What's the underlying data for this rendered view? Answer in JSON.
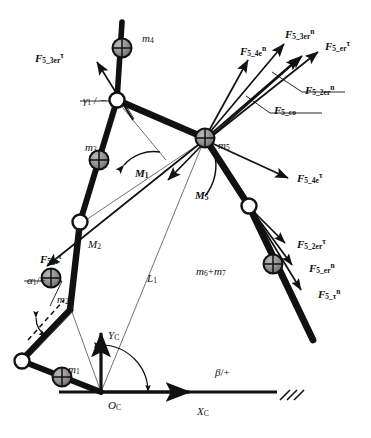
{
  "figure": {
    "type": "mechanism-free-body-diagram",
    "background": "#ffffff",
    "stroke": "#111111",
    "link_color": "#111111",
    "mass_fill": "#8a8a8a",
    "joint_fill": "#ffffff",
    "width": 371,
    "height": 438
  },
  "forces": [
    {
      "id": "f_5_3er_tau_left",
      "base": "F",
      "sub": "5_3er",
      "sup": "τ",
      "x": 35,
      "y": 52
    },
    {
      "id": "f_5_4e_n",
      "base": "F",
      "sub": "5_4e",
      "sup": "n",
      "x": 240,
      "y": 45
    },
    {
      "id": "f_5_3er_n",
      "base": "F",
      "sub": "5_3er",
      "sup": "n",
      "x": 285,
      "y": 28
    },
    {
      "id": "f_5_er_tau",
      "base": "F",
      "sub": "5_er",
      "sup": "τ",
      "x": 325,
      "y": 40
    },
    {
      "id": "f_5_2er_n",
      "base": "F",
      "sub": "5_2er",
      "sup": "n",
      "x": 305,
      "y": 84
    },
    {
      "id": "f_5_co",
      "base": "F",
      "sub": "5_co",
      "sup": "",
      "x": 274,
      "y": 105
    },
    {
      "id": "f_5_4e_tau",
      "base": "F",
      "sub": "5_4e",
      "sup": "τ",
      "x": 297,
      "y": 172
    },
    {
      "id": "f_5_2er_tau",
      "base": "F",
      "sub": "5_2er",
      "sup": "τ",
      "x": 297,
      "y": 238
    },
    {
      "id": "f_5_er_n",
      "base": "F",
      "sub": "5_er",
      "sup": "n",
      "x": 309,
      "y": 262
    },
    {
      "id": "f_5_tau_n",
      "base": "F",
      "sub": "5_τ",
      "sup": "n",
      "x": 318,
      "y": 288
    },
    {
      "id": "f_5_tau_tau",
      "base": "F",
      "sub": "5_τ",
      "sup": "τ",
      "x": 40,
      "y": 253
    }
  ],
  "masses": [
    {
      "id": "m4",
      "label": "m",
      "sub": "4",
      "x": 142,
      "y": 33
    },
    {
      "id": "m3",
      "label": "m",
      "sub": "3",
      "x": 85,
      "y": 142
    },
    {
      "id": "m5",
      "label": "m",
      "sub": "5",
      "x": 218,
      "y": 140
    },
    {
      "id": "m2",
      "label": "m",
      "sub": "2",
      "x": 57,
      "y": 294
    },
    {
      "id": "m1",
      "label": "m",
      "sub": "1",
      "x": 68,
      "y": 364
    },
    {
      "id": "m6m7",
      "label": "m",
      "sub": "6",
      "plus": "+m",
      "sub2": "7",
      "x": 196,
      "y": 266
    }
  ],
  "moments": [
    {
      "id": "M1",
      "label": "M",
      "sub": "1",
      "x": 135,
      "y": 168
    },
    {
      "id": "M5",
      "label": "M",
      "sub": "5",
      "x": 195,
      "y": 190
    },
    {
      "id": "M2",
      "label": "M",
      "sub": "2",
      "x": 88,
      "y": 239
    }
  ],
  "angles": [
    {
      "id": "gamma1",
      "label": "γ",
      "sub": "1",
      "suffix": "/ −",
      "x": 83,
      "y": 95
    },
    {
      "id": "alpha1",
      "label": "α",
      "sub": "1",
      "suffix": "/+",
      "x": 27,
      "y": 275
    },
    {
      "id": "beta",
      "label": "β",
      "sub": "",
      "suffix": "/+",
      "x": 215,
      "y": 367
    }
  ],
  "dimensions": [
    {
      "id": "L1",
      "label": "L",
      "sub": "1",
      "x": 147,
      "y": 273
    }
  ],
  "axes": [
    {
      "id": "Yc",
      "label": "Y",
      "sub": "C",
      "x": 108,
      "y": 330
    },
    {
      "id": "Xc",
      "label": "X",
      "sub": "C",
      "x": 197,
      "y": 406
    },
    {
      "id": "Oc",
      "label": "O",
      "sub": "C",
      "x": 108,
      "y": 400
    }
  ],
  "icons": {
    "mass_marker": "crosshair-circle-icon",
    "joint_marker": "open-circle-joint-icon",
    "ground": "hatched-ground-icon",
    "arrow": "arrow-head-icon"
  }
}
